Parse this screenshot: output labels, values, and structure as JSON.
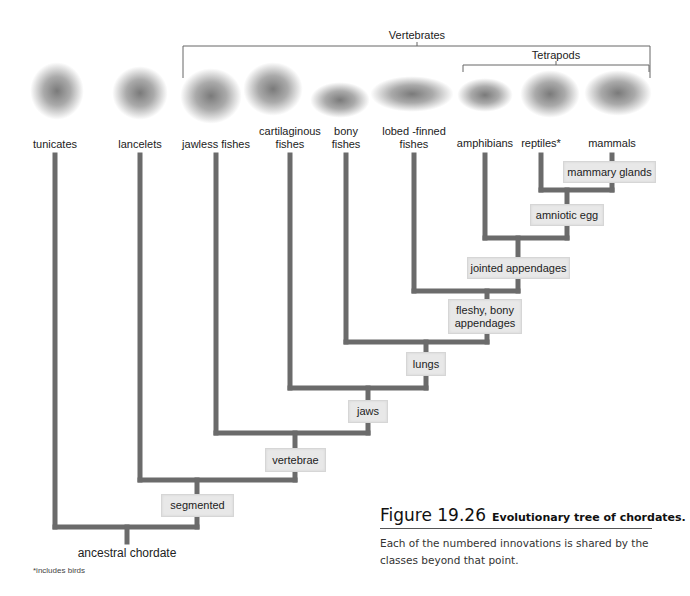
{
  "clades": {
    "vertebrates": "Vertebrates",
    "tetrapods": "Tetrapods"
  },
  "taxa": [
    {
      "id": "tunicates",
      "label": "tunicates",
      "x": 55
    },
    {
      "id": "lancelets",
      "label": "lancelets",
      "x": 140
    },
    {
      "id": "jawless-fishes",
      "label": "jawless fishes",
      "x": 216
    },
    {
      "id": "cartilaginous-fishes",
      "label_line1": "cartilaginous",
      "label_line2": "fishes",
      "x": 290
    },
    {
      "id": "bony-fishes",
      "label_line1": "bony",
      "label_line2": "fishes",
      "x": 346
    },
    {
      "id": "lobed-finned-fishes",
      "label_line1": "lobed -finned",
      "label_line2": "fishes",
      "x": 414
    },
    {
      "id": "amphibians",
      "label": "amphibians",
      "x": 485
    },
    {
      "id": "reptiles",
      "label": "reptiles*",
      "x": 541
    },
    {
      "id": "mammals",
      "label": "mammals",
      "x": 612
    }
  ],
  "traits": [
    {
      "label": "mammary glands"
    },
    {
      "label": "amniotic egg"
    },
    {
      "label": "jointed appendages"
    },
    {
      "label": "fleshy, bony appendages"
    },
    {
      "label": "lungs"
    },
    {
      "label": "jaws"
    },
    {
      "label": "vertebrae"
    },
    {
      "label": "segmented"
    }
  ],
  "root": {
    "label": "ancestral chordate"
  },
  "footnote": "*includes birds",
  "caption": {
    "figure_number": "Figure 19.26",
    "title": "Evolutionary tree of chordates.",
    "body": "Each of the numbered innovations is shared by the classes beyond that point."
  },
  "colors": {
    "branch": "#6b6b6b",
    "trait_box": "#e8e8e8",
    "bracket": "#666666"
  }
}
